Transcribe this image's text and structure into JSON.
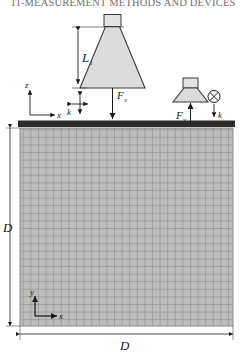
{
  "page": {
    "running_head": "IT-MEASUREMENT METHODS AND DEVICES"
  },
  "figure": {
    "name": "indentation-scheme",
    "specimen": {
      "width_label": "D",
      "height_label": "D",
      "fill_color": "#b9b9b9",
      "grid_color": "#8e8e8e",
      "top_bar_color": "#2b2b2b"
    },
    "indenter_large": {
      "label": "L1",
      "label_base": "L",
      "label_sub": "1",
      "fill_color": "#d8d8d8"
    },
    "indenter_small": {
      "fill_color": "#d8d8d8"
    },
    "forces": [
      {
        "name": "force-x",
        "base": "F",
        "sub": "x"
      },
      {
        "name": "force-y",
        "base": "F",
        "sub": "y"
      }
    ],
    "stiffness": [
      {
        "name": "stiffness-left",
        "label": "k"
      },
      {
        "name": "stiffness-right",
        "label": "k"
      }
    ],
    "axes_top": {
      "vertical_label": "z",
      "horizontal_label": "x"
    },
    "axes_bottom": {
      "vertical_label": "y",
      "horizontal_label": "x"
    },
    "symbols": {
      "circle_cross": "⊗"
    }
  }
}
